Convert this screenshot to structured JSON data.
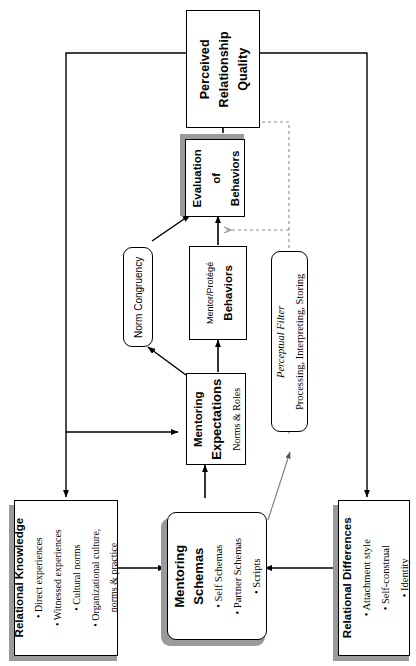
{
  "diagram": {
    "nodes": {
      "perceived_quality": {
        "label_line1": "Perceived",
        "label_line2": "Relationship",
        "label_line3": "Quality"
      },
      "evaluation": {
        "label_line1": "Evaluation",
        "label_line2": "of",
        "label_line3": "Behaviors"
      },
      "norm_congruency": {
        "label": "Norm Congruency"
      },
      "mentor_protege_behaviors": {
        "label_line1": "Mentor/Protégé",
        "label_line2": "Behaviors"
      },
      "perceptual_filter": {
        "label_line1": "Perceptual Filter",
        "label_line2": "Processing, Interpreting, Storing"
      },
      "mentoring_expectations": {
        "label_line1": "Mentoring",
        "label_line2": "Expectations",
        "label_line3": "Norms & Roles"
      },
      "relational_knowledge": {
        "title": "Relational Knowledge",
        "bullets": [
          "• Direct experiences",
          "• Witnessed experiences",
          "• Cultural norms",
          "• Organizational culture,",
          "norms & practice"
        ]
      },
      "mentoring_schemas": {
        "title_line1": "Mentoring",
        "title_line2": "Schemas",
        "bullets": [
          "• Self Schemas",
          "• Partner Schemas",
          "• Scripts"
        ]
      },
      "relational_differences": {
        "title": "Relational Differences",
        "bullets": [
          "• Attachment style",
          "• Self-construal",
          "• Identity"
        ]
      }
    },
    "colors": {
      "line": "#000000",
      "dotted_line": "#8c8c8c",
      "shadow": "#9a9a9a",
      "box_fill": "#ffffff",
      "background": "#ffffff"
    }
  }
}
